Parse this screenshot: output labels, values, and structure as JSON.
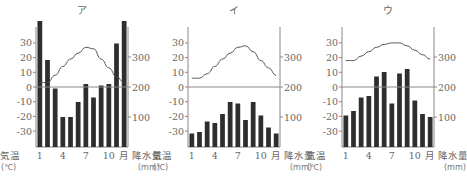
{
  "chart_data": [
    {
      "type": "bar+line",
      "title": "ア",
      "categories": [
        "1",
        "2",
        "3",
        "4",
        "5",
        "6",
        "7",
        "8",
        "9",
        "10",
        "11",
        "12"
      ],
      "xtick_labels": [
        "1",
        "4",
        "7",
        "10"
      ],
      "x_unit_label": "月",
      "left_axis": {
        "label": "気温",
        "unit": "(℃)",
        "ticks": [
          30,
          20,
          10,
          0,
          -10,
          -20,
          -30
        ],
        "ylim": [
          -40,
          40
        ]
      },
      "right_axis": {
        "label": "降水量",
        "unit": "(mm)",
        "ticks": [
          300,
          200,
          100
        ],
        "ylim": [
          0,
          400
        ]
      },
      "series": [
        {
          "name": "気温",
          "type": "line",
          "values": [
            3,
            3,
            8,
            14,
            19,
            23,
            27,
            26,
            19,
            13,
            7,
            3
          ]
        },
        {
          "name": "降水量",
          "type": "bar",
          "values": [
            420,
            290,
            195,
            100,
            100,
            150,
            210,
            165,
            205,
            210,
            345,
            420
          ]
        }
      ]
    },
    {
      "type": "bar+line",
      "title": "イ",
      "categories": [
        "1",
        "2",
        "3",
        "4",
        "5",
        "6",
        "7",
        "8",
        "9",
        "10",
        "11",
        "12"
      ],
      "xtick_labels": [
        "1",
        "4",
        "7",
        "10"
      ],
      "x_unit_label": "月",
      "left_axis": {
        "label": "気温",
        "unit": "(℃)",
        "ticks": [
          30,
          20,
          10,
          0,
          -10,
          -20,
          -30
        ],
        "ylim": [
          -40,
          40
        ]
      },
      "right_axis": {
        "label": "降水量",
        "unit": "(mm)",
        "ticks": [
          300,
          200,
          100
        ],
        "ylim": [
          0,
          400
        ]
      },
      "series": [
        {
          "name": "気温",
          "type": "line",
          "values": [
            6,
            6,
            9,
            14,
            19,
            23,
            27,
            28,
            24,
            18,
            13,
            8
          ]
        },
        {
          "name": "降水量",
          "type": "bar",
          "values": [
            45,
            50,
            85,
            80,
            110,
            150,
            145,
            90,
            150,
            105,
            65,
            45
          ]
        }
      ]
    },
    {
      "type": "bar+line",
      "title": "ウ",
      "categories": [
        "1",
        "2",
        "3",
        "4",
        "5",
        "6",
        "7",
        "8",
        "9",
        "10",
        "11",
        "12"
      ],
      "xtick_labels": [
        "1",
        "4",
        "7",
        "10"
      ],
      "x_unit_label": "月",
      "left_axis": {
        "label": "気温",
        "unit": "(℃)",
        "ticks": [
          30,
          20,
          10,
          0,
          -10,
          -20,
          -30
        ],
        "ylim": [
          -40,
          40
        ]
      },
      "right_axis": {
        "label": "降水量",
        "unit": "(mm)",
        "ticks": [
          300,
          200,
          100
        ],
        "ylim": [
          0,
          400
        ]
      },
      "series": [
        {
          "name": "気温",
          "type": "line",
          "values": [
            18,
            18,
            21,
            24,
            27,
            29,
            30,
            30,
            28,
            25,
            22,
            19
          ]
        },
        {
          "name": "降水量",
          "type": "bar",
          "values": [
            105,
            120,
            165,
            170,
            235,
            250,
            145,
            245,
            260,
            155,
            110,
            100
          ]
        }
      ]
    }
  ]
}
